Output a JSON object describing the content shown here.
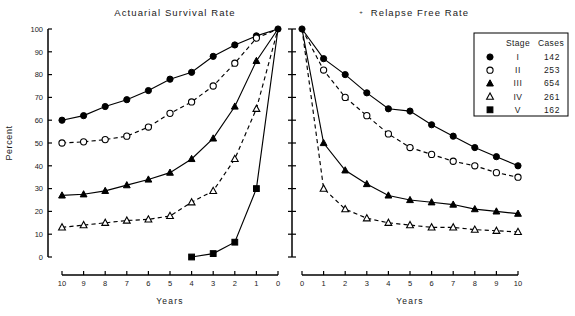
{
  "figure": {
    "width": 575,
    "height": 316,
    "background": "#ffffff",
    "ink_color": "#000000"
  },
  "panels": {
    "left": {
      "title": "Actuarial Survival Rate",
      "xlabel": "Years",
      "ylabel": "Percent",
      "x_ticks": [
        "10",
        "9",
        "8",
        "7",
        "6",
        "5",
        "4",
        "3",
        "2",
        "1",
        "0"
      ],
      "y_ticks": [
        "0",
        "10",
        "20",
        "30",
        "40",
        "50",
        "60",
        "70",
        "80",
        "90",
        "100"
      ],
      "x_direction": "reversed"
    },
    "right": {
      "title": "Relapse Free Rate",
      "title_marker": "+",
      "xlabel": "Years",
      "x_ticks": [
        "0",
        "1",
        "2",
        "3",
        "4",
        "5",
        "6",
        "7",
        "8",
        "9",
        "10"
      ],
      "x_direction": "normal"
    }
  },
  "legend": {
    "header_stage": "Stage",
    "header_cases": "Cases",
    "rows": [
      {
        "marker": "filled-circle",
        "stage": "I",
        "cases": "142"
      },
      {
        "marker": "open-circle",
        "stage": "II",
        "cases": "253"
      },
      {
        "marker": "filled-triangle",
        "stage": "III",
        "cases": "654"
      },
      {
        "marker": "open-triangle",
        "stage": "IV",
        "cases": "261"
      },
      {
        "marker": "filled-square",
        "stage": "V",
        "cases": "162"
      }
    ]
  },
  "chart_data": {
    "type": "line",
    "xlabel": "Years",
    "ylabel": "Percent",
    "ylim": [
      0,
      100
    ],
    "y_ticks": [
      0,
      10,
      20,
      30,
      40,
      50,
      60,
      70,
      80,
      90,
      100
    ],
    "grid": false,
    "legend_position": "top-right",
    "panels": [
      {
        "name": "Actuarial Survival Rate",
        "xlim": [
          10,
          0
        ],
        "x": [
          10,
          9,
          8,
          7,
          6,
          5,
          4,
          3,
          2,
          1,
          0
        ],
        "series": [
          {
            "name": "Stage I",
            "cases": 142,
            "marker": "filled-circle",
            "line": "solid",
            "values": [
              60,
              62,
              66,
              69,
              73,
              78,
              81,
              88,
              93,
              97,
              100
            ]
          },
          {
            "name": "Stage II",
            "cases": 253,
            "marker": "open-circle",
            "line": "dashed",
            "values": [
              50,
              50.5,
              51.5,
              53,
              57,
              63,
              68,
              75,
              85,
              96,
              100
            ]
          },
          {
            "name": "Stage III",
            "cases": 654,
            "marker": "filled-triangle",
            "line": "solid",
            "values": [
              27,
              27.5,
              29,
              31.5,
              34,
              37,
              43,
              52,
              66,
              86,
              100
            ]
          },
          {
            "name": "Stage IV",
            "cases": 261,
            "marker": "open-triangle",
            "line": "dashed",
            "values": [
              13,
              14,
              15,
              16,
              16.5,
              18,
              24,
              29,
              43,
              65,
              100
            ]
          },
          {
            "name": "Stage V",
            "cases": 162,
            "marker": "filled-square",
            "line": "solid",
            "x": [
              4,
              3,
              2,
              1,
              0
            ],
            "values": [
              0,
              1.5,
              6.5,
              30,
              100
            ]
          }
        ]
      },
      {
        "name": "Relapse Free Rate",
        "xlim": [
          0,
          10
        ],
        "x": [
          0,
          1,
          2,
          3,
          4,
          5,
          6,
          7,
          8,
          9,
          10
        ],
        "series": [
          {
            "name": "Stage I",
            "cases": 142,
            "marker": "filled-circle",
            "line": "solid",
            "values": [
              100,
              87,
              80,
              72,
              65,
              64,
              58,
              53,
              48,
              44,
              40
            ]
          },
          {
            "name": "Stage II",
            "cases": 253,
            "marker": "open-circle",
            "line": "dashed",
            "values": [
              100,
              82,
              70,
              62,
              54,
              48,
              45,
              42,
              40,
              37,
              35
            ]
          },
          {
            "name": "Stage III",
            "cases": 654,
            "marker": "filled-triangle",
            "line": "solid",
            "values": [
              100,
              50,
              38,
              32,
              27,
              25,
              24,
              23,
              21,
              20,
              19
            ]
          },
          {
            "name": "Stage IV",
            "cases": 261,
            "marker": "open-triangle",
            "line": "dashed",
            "values": [
              100,
              30,
              21,
              17,
              15,
              14,
              13,
              13,
              12,
              11.5,
              11
            ]
          }
        ]
      }
    ]
  }
}
